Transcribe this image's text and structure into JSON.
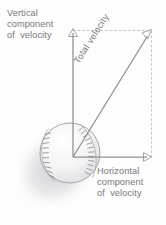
{
  "diagram": {
    "labels": {
      "vertical": "Vertical\ncomponent\nof  velocity",
      "horizontal": "Horizontal\ncomponent\nof  velocity",
      "total": "Total  velocity"
    },
    "colors": {
      "background": "#fdfdfd",
      "text": "#77787c",
      "vector_stroke": "#8d8f93",
      "dashed_stroke": "#b9bbbf",
      "ball_outline": "#9a9ca0",
      "ball_fill": "#f2f2f3",
      "stitch": "#8e9094",
      "shadow": "#d9dadc"
    },
    "vectors": [
      {
        "name": "vertical-component",
        "from": [
          73,
          157
        ],
        "to": [
          73,
          31
        ],
        "arrowhead": "open-up"
      },
      {
        "name": "horizontal-component",
        "from": [
          73,
          157
        ],
        "to": [
          151,
          157
        ],
        "arrowhead": "open-right"
      },
      {
        "name": "total-velocity",
        "from": [
          73,
          157
        ],
        "to": [
          151,
          31
        ],
        "arrowhead": "open-diagonal"
      }
    ],
    "dashed_guides": [
      {
        "name": "top-guide",
        "from": [
          73,
          31
        ],
        "to": [
          151,
          31
        ]
      },
      {
        "name": "right-guide",
        "from": [
          151,
          31
        ],
        "to": [
          151,
          157
        ]
      }
    ],
    "ball": {
      "name": "baseball",
      "center": [
        70,
        153
      ],
      "radius": 30,
      "stitch_rows": 2
    }
  }
}
